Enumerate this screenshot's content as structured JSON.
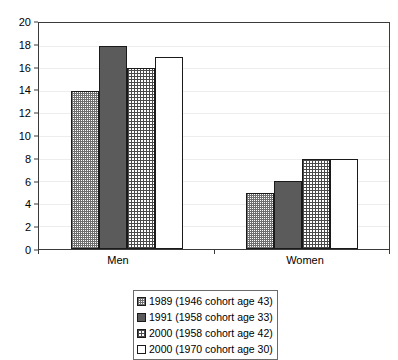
{
  "chart_data": {
    "type": "bar",
    "title": "",
    "subtitle": "",
    "xlabel": "",
    "ylabel": "",
    "categories": [
      "Men",
      "Women"
    ],
    "series": [
      {
        "name": "1989 (1946 cohort age 43)",
        "pattern": "stipple",
        "values": [
          14,
          5
        ]
      },
      {
        "name": "1991 (1958 cohort age 33)",
        "pattern": "solid",
        "values": [
          18,
          6
        ]
      },
      {
        "name": "2000 (1958 cohort age 42)",
        "pattern": "grid",
        "values": [
          16,
          8
        ]
      },
      {
        "name": "2000 (1970 cohort age 30)",
        "pattern": "white",
        "values": [
          17,
          8
        ]
      }
    ],
    "ylim": [
      0,
      20
    ],
    "yticks": [
      0,
      2,
      4,
      6,
      8,
      10,
      12,
      14,
      16,
      18,
      20
    ],
    "ytick_labels": [
      "0",
      "2",
      "4",
      "6",
      "8",
      "10",
      "12",
      "14",
      "16",
      "18",
      "20"
    ],
    "grid": true,
    "grid_axis": "y",
    "legend_position": "bottom-center",
    "annotations": []
  },
  "axis": {
    "y_tick_labels": [
      "20",
      "18",
      "16",
      "14",
      "12",
      "10",
      "8",
      "6",
      "4",
      "2",
      "0"
    ],
    "x_tick_labels": [
      "Men",
      "Women"
    ]
  },
  "legend": {
    "items": [
      {
        "label": "1989 (1946 cohort age 43)",
        "swatch": "stipple-swatch"
      },
      {
        "label": "1991 (1958 cohort age 33)",
        "swatch": "solid-swatch"
      },
      {
        "label": "2000 (1958 cohort age 42)",
        "swatch": "grid-swatch"
      },
      {
        "label": "2000 (1970 cohort age 30)",
        "swatch": "white-swatch"
      }
    ]
  },
  "colors": {
    "axis_line": "#3a3a3a",
    "bar_outline": "#1a1a1a",
    "gridline": "#ededed",
    "solid_fill": "#5b5b5b",
    "hatch_ink": "#4a4a4a",
    "background": "#ffffff"
  }
}
